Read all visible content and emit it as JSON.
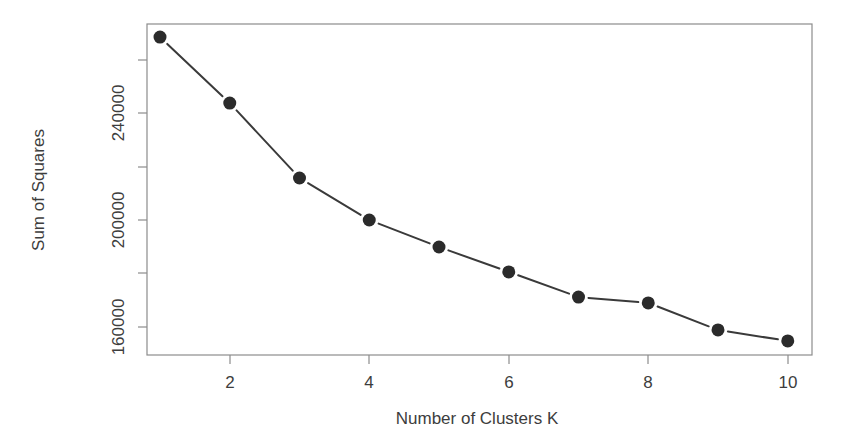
{
  "chart_data": {
    "type": "line",
    "title": "",
    "subtitle": "",
    "xlabel": "Number of Clusters K",
    "ylabel": "Sum of Squares",
    "x": [
      1,
      2,
      3,
      4,
      5,
      6,
      7,
      8,
      9,
      10
    ],
    "values": [
      268400,
      243700,
      215700,
      200000,
      189900,
      180600,
      171200,
      169000,
      158900,
      154800
    ],
    "series": [
      {
        "name": "Sum of Squares",
        "values": [
          268400,
          243700,
          215700,
          200000,
          189900,
          180600,
          171200,
          169000,
          158900,
          154800
        ]
      }
    ],
    "xtick_labels": [
      "2",
      "4",
      "6",
      "8",
      "10"
    ],
    "xtick_values": [
      2,
      4,
      6,
      8,
      10
    ],
    "ytick_labels": [
      "160000",
      "200000",
      "240000"
    ],
    "ytick_values": [
      160000,
      200000,
      240000
    ],
    "yminor_tick_values": [
      140000,
      180000,
      220000,
      260000
    ],
    "xlim": [
      0.6,
      10.4
    ],
    "ylim": [
      151000,
      272000
    ],
    "grid": false,
    "legend": "none",
    "marker": "filled-circle",
    "marker_color": "#2b2b2b",
    "line_color": "#3a3a3a",
    "axis_color": "#8c8c8c",
    "background_color": "#ffffff"
  },
  "axes": {
    "x_title": "Number of Clusters K",
    "y_title": "Sum of Squares"
  }
}
